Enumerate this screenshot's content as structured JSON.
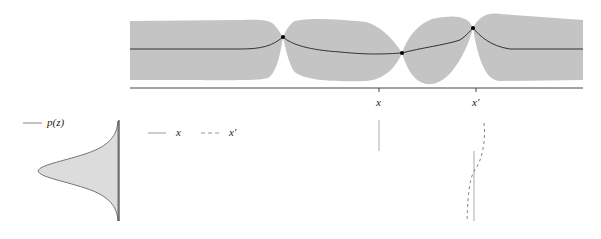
{
  "figure": {
    "top_panel": {
      "description": "Gaussian process posterior: mean and uncertainty band",
      "band_color": "#c4c4c4",
      "mean_color": "#333333",
      "axis_ticks": [
        {
          "label": "x",
          "pos": 379
        },
        {
          "label": "x′",
          "pos": 476
        }
      ],
      "observations": [
        {
          "x": 283,
          "y": 37
        },
        {
          "x": 402,
          "y": 53
        },
        {
          "x": 473,
          "y": 28
        }
      ]
    },
    "density_panel": {
      "legend_label": "p(z)",
      "fill_color": "#dcdcdc"
    },
    "legend": {
      "solid_label": "x",
      "dashed_label": "x′"
    }
  }
}
